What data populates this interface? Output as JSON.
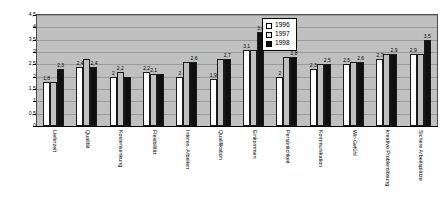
{
  "chart_data": {
    "type": "bar",
    "title": "",
    "subtitle": "",
    "xlabel": "",
    "ylabel": "",
    "ylim": [
      0,
      4.5
    ],
    "ytick_step": 0.5,
    "ytick_labels": [
      "0",
      "0,5",
      "1",
      "1,5",
      "2",
      "2,5",
      "3",
      "3,5",
      "4",
      "4,5"
    ],
    "grid": true,
    "legend_position": "top-right",
    "decimal_separator": ",",
    "plot_background": "#c0c0c0",
    "categories": [
      "Lieferzeit",
      "Qualität",
      "Kostensenkung",
      "Flexibilität",
      "Interes. Arbeiten",
      "Qualifikation",
      "Einkommen",
      "Persönlichkeit",
      "Kommunikation",
      "Wir-Gefühl",
      "kreative Problemlösung",
      "Sichere Arbeitsplätze"
    ],
    "series": [
      {
        "name": "1996",
        "color": "#ffffff",
        "values": [
          1.8,
          2.4,
          2.0,
          2.2,
          2.0,
          1.9,
          3.1,
          2.0,
          2.3,
          2.5,
          2.7,
          2.9
        ],
        "labels": [
          "1,8",
          "2,4",
          "2",
          "2,2",
          "2",
          "1,9",
          "3,1",
          "2",
          "2,3",
          "2,5",
          "2,7",
          "2,9"
        ]
      },
      {
        "name": "1997",
        "color": "#c0c0c0",
        "values": [
          1.8,
          2.7,
          2.2,
          2.1,
          2.6,
          2.7,
          3.1,
          2.8,
          2.5,
          2.6,
          2.9,
          2.9
        ],
        "labels": [
          "",
          "",
          "2,2",
          "2,1",
          "",
          "",
          "",
          "",
          "",
          "",
          "",
          ""
        ]
      },
      {
        "name": "1998",
        "color": "#101010",
        "values": [
          2.3,
          2.4,
          2.0,
          2.1,
          2.6,
          2.7,
          3.8,
          2.8,
          2.5,
          2.6,
          2.9,
          3.5
        ],
        "labels": [
          "2,3",
          "2,4",
          "",
          "",
          "2,6",
          "2,7",
          "3,8",
          "2,8",
          "2,5",
          "2,6",
          "2,9",
          "3,5"
        ]
      }
    ],
    "top_labels": [
      {
        "text": "1,8",
        "group": 0
      },
      {
        "text": "2,3",
        "group": 0
      },
      {
        "text": "2,4",
        "group": 1
      },
      {
        "text": "2,4",
        "group": 1
      },
      {
        "text": "2",
        "group": 2
      },
      {
        "text": "2,2",
        "group": 2
      },
      {
        "text": "2,2",
        "group": 3
      },
      {
        "text": "2,1",
        "group": 3
      },
      {
        "text": "2",
        "group": 4
      },
      {
        "text": "2,6",
        "group": 4
      },
      {
        "text": "1,9",
        "group": 5
      },
      {
        "text": "2,7",
        "group": 5
      },
      {
        "text": "3,1",
        "group": 6
      },
      {
        "text": "3,8",
        "group": 6
      },
      {
        "text": "2",
        "group": 7
      },
      {
        "text": "2,8",
        "group": 7
      },
      {
        "text": "2,3",
        "group": 8
      },
      {
        "text": "2,5",
        "group": 8
      },
      {
        "text": "2,5",
        "group": 9
      },
      {
        "text": "2,6",
        "group": 9
      },
      {
        "text": "2,7",
        "group": 10
      },
      {
        "text": "2,9",
        "group": 10
      },
      {
        "text": "2,9",
        "group": 11
      },
      {
        "text": "3,5",
        "group": 11
      }
    ]
  },
  "legend": {
    "entries": [
      {
        "label": "1996",
        "swatch": "white-square-swatch"
      },
      {
        "label": "1997",
        "swatch": "light-gray-square-swatch"
      },
      {
        "label": "1998",
        "swatch": "black-square-swatch"
      }
    ]
  }
}
